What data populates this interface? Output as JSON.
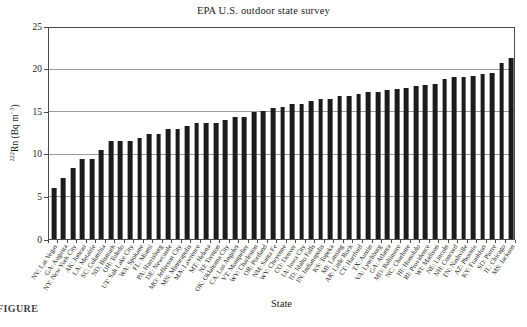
{
  "figure": {
    "title": "EPA U.S. outdoor state survey",
    "xlabel": "State",
    "ylabel_parts": {
      "mass_number": "222",
      "mid": "Rn (Bq m",
      "exponent": "−3",
      "end": ")"
    },
    "caption_fragment": "FIGURE",
    "colors": {
      "bar": "#1c1c1c",
      "grid": "#9a9a9a",
      "axis": "#4a4a4a",
      "text": "#1a1a1a",
      "background": "#ffffff"
    }
  },
  "chart_data": {
    "type": "bar",
    "title": "EPA U.S. outdoor state survey",
    "xlabel": "State",
    "ylabel": "222Rn (Bq m-3)",
    "ylim": [
      0,
      25
    ],
    "yticks": [
      0,
      5,
      10,
      15,
      20,
      25
    ],
    "grid": true,
    "legend": false,
    "bar_color": "#1c1c1c",
    "categories": [
      "NV: Las Vegas",
      "GA: Augusta",
      "NY: New York City",
      "AK: Juneau",
      "LA: Metairie",
      "SC: Columbia",
      "ND: Bismark",
      "OH: Toledo",
      "UT: Salt Lake City",
      "WA: Spokane",
      "FL: Miami",
      "PA: Harrisburg",
      "DE: Newcastle",
      "MO: Jefferson City",
      "MN: Minneapolis",
      "MA: Lawrence",
      "MT: Helena",
      "NJ: Trenton",
      "OK: Oklahoma City",
      "CA: Los Angeles",
      "VT: Montpelier",
      "WV: Charleston",
      "OR: Portland",
      "NM: Santa Fe",
      "WY: Cheyenne",
      "CO: Denver",
      "IA: Iowa City",
      "ID: Idaho Falls",
      "IN: Indianapolis",
      "KS: Topeka",
      "MI: Lansing",
      "AR: Little Rock",
      "CT: Hartford",
      "TX: Austin",
      "VA: Lynchburg",
      "GA: Atlanta",
      "MD: Baltimore",
      "NC: Charlotte",
      "HI: Honolulu",
      "RI: Providence",
      "WI: Madison",
      "NE: Lincoln",
      "NH: Concord",
      "TN: Nashville",
      "AZ: Phoenix",
      "KY: Frankfort",
      "SD: Pierre",
      "IL: Chicago",
      "MS: Jackson"
    ],
    "values": [
      6.0,
      7.2,
      8.4,
      9.5,
      9.5,
      10.6,
      11.6,
      11.6,
      11.6,
      12.0,
      12.4,
      12.4,
      13.0,
      13.0,
      13.4,
      13.7,
      13.8,
      13.8,
      14.1,
      14.5,
      14.5,
      15.0,
      15.2,
      15.5,
      15.6,
      16.0,
      16.0,
      16.3,
      16.6,
      16.6,
      16.9,
      16.9,
      17.2,
      17.4,
      17.4,
      17.7,
      17.8,
      17.9,
      18.1,
      18.3,
      18.4,
      19.0,
      19.2,
      19.2,
      19.3,
      19.5,
      19.7,
      20.9,
      21.5
    ]
  }
}
